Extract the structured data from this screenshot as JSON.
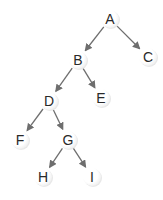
{
  "diagram": {
    "type": "binary-tree",
    "colors": {
      "background": "#ffffff",
      "node_fill": "#ffffff",
      "node_shadow": "#d8d8d8",
      "edge": "#6e6e6e",
      "label": "#2a2a2a"
    },
    "nodes": [
      {
        "id": "A",
        "label": "A",
        "x": 110,
        "y": 19
      },
      {
        "id": "B",
        "label": "B",
        "x": 78,
        "y": 60
      },
      {
        "id": "C",
        "label": "C",
        "x": 148,
        "y": 57
      },
      {
        "id": "D",
        "label": "D",
        "x": 49,
        "y": 101
      },
      {
        "id": "E",
        "label": "E",
        "x": 101,
        "y": 98
      },
      {
        "id": "F",
        "label": "F",
        "x": 20,
        "y": 140
      },
      {
        "id": "G",
        "label": "G",
        "x": 68,
        "y": 140
      },
      {
        "id": "H",
        "label": "H",
        "x": 43,
        "y": 177
      },
      {
        "id": "I",
        "label": "I",
        "x": 92,
        "y": 177
      }
    ],
    "edges": [
      {
        "from": "A",
        "to": "B"
      },
      {
        "from": "A",
        "to": "C"
      },
      {
        "from": "B",
        "to": "D"
      },
      {
        "from": "B",
        "to": "E"
      },
      {
        "from": "D",
        "to": "F"
      },
      {
        "from": "D",
        "to": "G"
      },
      {
        "from": "G",
        "to": "H"
      },
      {
        "from": "G",
        "to": "I"
      }
    ]
  }
}
